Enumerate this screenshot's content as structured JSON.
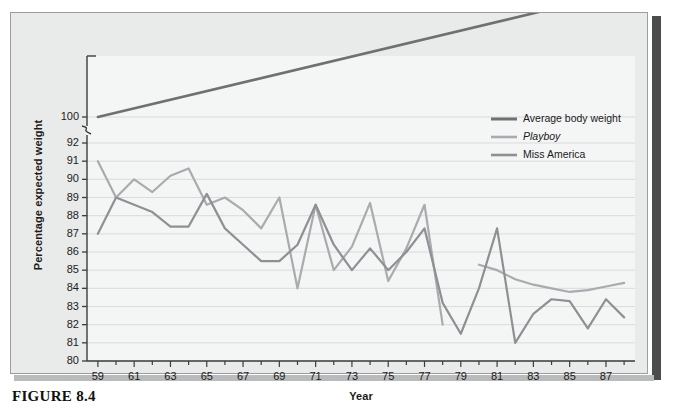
{
  "figure": {
    "caption": "FIGURE 8.4"
  },
  "chart_data": {
    "type": "line",
    "title": "",
    "xlabel": "Year",
    "ylabel": "Percentage expected weight",
    "grid": true,
    "legend_position": "inside-upper-right",
    "xlim": [
      58.4,
      88.6
    ],
    "ylim": [
      80,
      100
    ],
    "y_axis_break": {
      "between": [
        92,
        100
      ],
      "symbol": "zigzag"
    },
    "ytick_labels": [
      "80",
      "81",
      "82",
      "83",
      "84",
      "85",
      "86",
      "87",
      "88",
      "89",
      "90",
      "91",
      "92",
      "100"
    ],
    "yticks": [
      80,
      81,
      82,
      83,
      84,
      85,
      86,
      87,
      88,
      89,
      90,
      91,
      92,
      100
    ],
    "xtick_labels": [
      "59",
      "61",
      "63",
      "65",
      "67",
      "69",
      "71",
      "73",
      "75",
      "77",
      "79",
      "81",
      "83",
      "85",
      "87"
    ],
    "xticks": [
      59,
      61,
      63,
      65,
      67,
      69,
      71,
      73,
      75,
      77,
      79,
      81,
      83,
      85,
      87
    ],
    "x": [
      59,
      60,
      61,
      62,
      63,
      64,
      65,
      66,
      67,
      68,
      69,
      70,
      71,
      72,
      73,
      74,
      75,
      76,
      77,
      78,
      79,
      80,
      81,
      82,
      83,
      84,
      85,
      86,
      87,
      88
    ],
    "series": [
      {
        "name": "Average body weight",
        "color": "#6e7073",
        "width": 2.6,
        "points": [
          [
            59,
            100.0
          ],
          [
            88,
            107.5
          ]
        ]
      },
      {
        "name": "Playboy",
        "color": "#a9abae",
        "width": 2.2,
        "italic": true,
        "values": [
          91.0,
          89.0,
          90.0,
          89.3,
          90.2,
          90.6,
          88.6,
          89.0,
          88.3,
          87.3,
          89.0,
          84.0,
          88.6,
          85.0,
          86.3,
          88.7,
          84.4,
          86.2,
          88.6,
          82.0,
          null,
          85.3,
          85.0,
          84.5,
          84.2,
          84.0,
          83.8,
          83.9,
          84.1,
          84.3
        ]
      },
      {
        "name": "Miss America",
        "color": "#8e9093",
        "width": 2.2,
        "values": [
          87.0,
          89.0,
          88.6,
          88.2,
          87.4,
          87.4,
          89.2,
          87.3,
          86.4,
          85.5,
          85.5,
          86.4,
          88.6,
          86.4,
          85.0,
          86.2,
          85.0,
          86.0,
          87.3,
          83.2,
          81.5,
          84.0,
          87.3,
          81.0,
          82.6,
          83.4,
          83.3,
          81.8,
          83.4,
          82.4
        ]
      }
    ]
  }
}
